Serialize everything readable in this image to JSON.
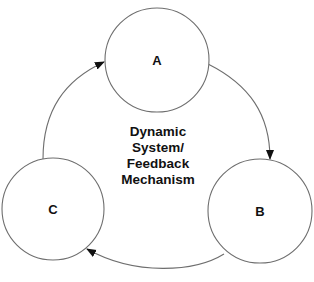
{
  "diagram": {
    "type": "cycle",
    "center_label": {
      "lines": [
        "Dynamic",
        "System/",
        "Feedback",
        "Mechanism"
      ]
    },
    "nodes": [
      {
        "id": "A",
        "label": "A"
      },
      {
        "id": "B",
        "label": "B"
      },
      {
        "id": "C",
        "label": "C"
      }
    ],
    "edges": [
      {
        "from": "A",
        "to": "B"
      },
      {
        "from": "B",
        "to": "C"
      },
      {
        "from": "C",
        "to": "A"
      }
    ],
    "colors": {
      "stroke": "#6e6e6e",
      "text": "#111111",
      "background": "#ffffff"
    }
  }
}
